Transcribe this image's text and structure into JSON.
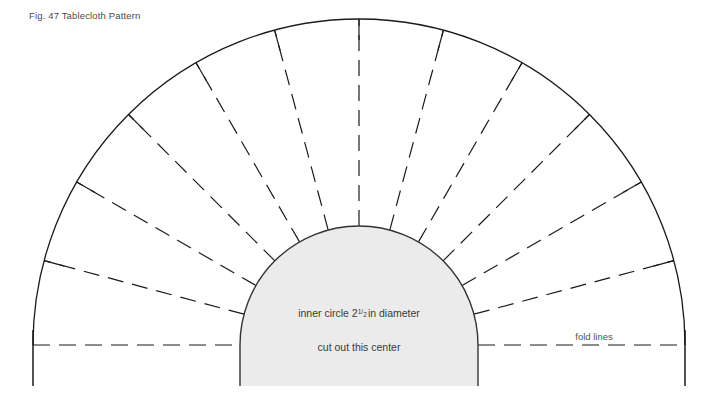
{
  "figure": {
    "title": "Fig. 47  Tablecloth Pattern",
    "labels": {
      "inner_circle_prefix": "inner circle 2",
      "inner_circle_fraction_numerator": "1",
      "inner_circle_fraction_denominator": "2",
      "inner_circle_suffix": "in diameter",
      "inner_circle_full": "inner circle 2 1/2 in diameter",
      "cut_out": "cut out this center",
      "fold_lines": "fold lines"
    },
    "colors": {
      "background": "#ffffff",
      "line": "#1a1a1a",
      "inner_fill": "#ebebeb",
      "inner_stroke": "#333333",
      "title_text": "#4a4a4a",
      "label_text": "#3a3a3a"
    },
    "geometry": {
      "center_x": 359,
      "center_y": 345,
      "outer_radius": 326,
      "inner_radius": 119,
      "baseline_y": 345,
      "tail_bottom_y": 386,
      "spoke_count": 11,
      "sector_count": 12,
      "spoke_angles_deg": [
        0,
        15,
        30,
        45,
        60,
        75,
        90,
        105,
        120,
        135,
        150,
        165,
        180
      ]
    }
  }
}
